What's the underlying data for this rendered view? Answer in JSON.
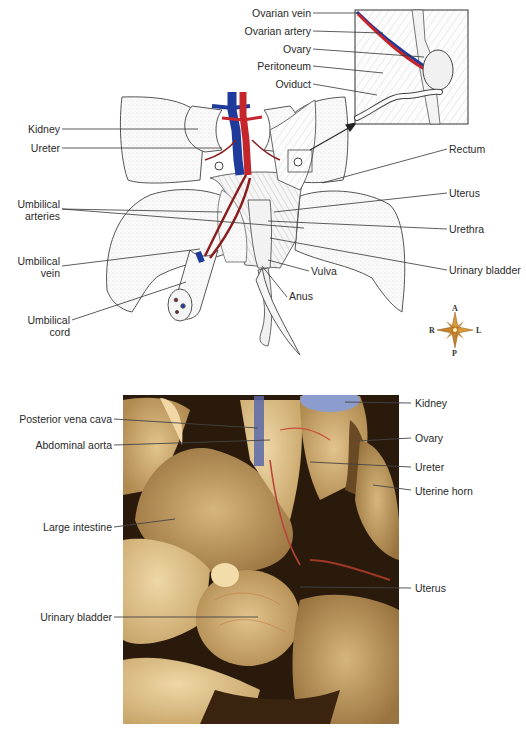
{
  "figure": {
    "illustration": {
      "name": "female-urogenital-illustration",
      "labels_left": [
        {
          "id": "kidney",
          "text": "Kidney"
        },
        {
          "id": "ureter",
          "text": "Ureter"
        },
        {
          "id": "umbilical-arteries",
          "text": "Umbilical\narteries"
        },
        {
          "id": "umbilical-vein",
          "text": "Umbilical\nvein"
        },
        {
          "id": "umbilical-cord",
          "text": "Umbilical\ncord"
        }
      ],
      "labels_inset": [
        {
          "id": "ovarian-vein",
          "text": "Ovarian vein"
        },
        {
          "id": "ovarian-artery",
          "text": "Ovarian artery"
        },
        {
          "id": "ovary",
          "text": "Ovary"
        },
        {
          "id": "peritoneum",
          "text": "Peritoneum"
        },
        {
          "id": "oviduct",
          "text": "Oviduct"
        }
      ],
      "labels_right": [
        {
          "id": "rectum",
          "text": "Rectum"
        },
        {
          "id": "uterus",
          "text": "Uterus"
        },
        {
          "id": "urethra",
          "text": "Urethra"
        },
        {
          "id": "urinary-bladder",
          "text": "Urinary bladder"
        }
      ],
      "labels_bottom": [
        {
          "id": "vulva",
          "text": "Vulva"
        },
        {
          "id": "anus",
          "text": "Anus"
        }
      ],
      "compass": {
        "top": "A",
        "bottom": "P",
        "left": "R",
        "right": "L"
      }
    },
    "photo": {
      "name": "dissection-photograph",
      "labels_left": [
        {
          "id": "posterior-vena-cava",
          "text": "Posterior vena cava"
        },
        {
          "id": "abdominal-aorta",
          "text": "Abdominal aorta"
        },
        {
          "id": "large-intestine",
          "text": "Large intestine"
        },
        {
          "id": "urinary-bladder",
          "text": "Urinary bladder"
        }
      ],
      "labels_right": [
        {
          "id": "kidney",
          "text": "Kidney"
        },
        {
          "id": "ovary",
          "text": "Ovary"
        },
        {
          "id": "ureter",
          "text": "Ureter"
        },
        {
          "id": "uterine-horn",
          "text": "Uterine horn"
        },
        {
          "id": "uterus",
          "text": "Uterus"
        }
      ]
    },
    "colors": {
      "vein": "#1e3a9a",
      "artery": "#c4262b",
      "arterial_dark": "#8a1e1e",
      "tissue": "#d8b77a",
      "tissue_dark": "#8a6a3a",
      "compass": "#d89a3a"
    }
  }
}
